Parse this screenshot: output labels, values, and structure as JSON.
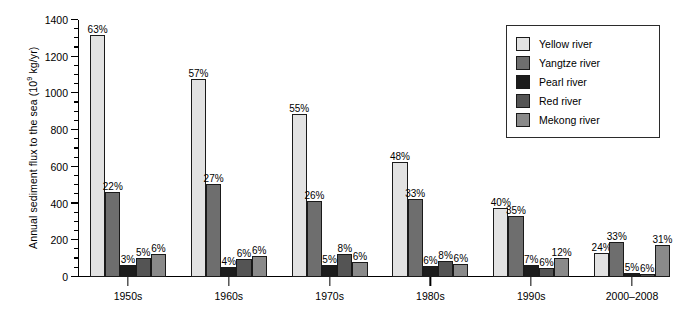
{
  "chart_data": {
    "type": "bar",
    "title": "",
    "xlabel": "",
    "ylabel": "Annual sediment flux to the sea (10⁹ kg/yr)",
    "ylabel_prefix": "Annual sediment flux to the sea (10",
    "ylabel_exponent": "9",
    "ylabel_suffix": " kg/yr)",
    "ylim": [
      0,
      1400
    ],
    "ytick_step": 200,
    "yminor_step": 50,
    "grid": false,
    "legend_position": "top-right",
    "categories": [
      "1950s",
      "1960s",
      "1970s",
      "1980s",
      "1990s",
      "2000–2008"
    ],
    "series": [
      {
        "name": "Yellow river",
        "color": "#e2e2e2",
        "values": [
          1320,
          1080,
          890,
          625,
          375,
          130
        ],
        "labels": [
          "63%",
          "57%",
          "55%",
          "48%",
          "40%",
          "24%"
        ]
      },
      {
        "name": "Yangtze river",
        "color": "#6e6e6e",
        "values": [
          465,
          505,
          415,
          425,
          330,
          190
        ],
        "labels": [
          "22%",
          "27%",
          "26%",
          "33%",
          "35%",
          "33%"
        ]
      },
      {
        "name": "Pearl river",
        "color": "#1c1c1c",
        "values": [
          65,
          55,
          65,
          60,
          65,
          20
        ],
        "labels": [
          "3%",
          "4%",
          "5%",
          "6%",
          "7%",
          "5%"
        ]
      },
      {
        "name": "Red river",
        "color": "#545454",
        "values": [
          105,
          100,
          125,
          85,
          48,
          15
        ],
        "labels": [
          "5%",
          "6%",
          "8%",
          "8%",
          "6%",
          "6%"
        ]
      },
      {
        "name": "Mekong river",
        "color": "#8a8a8a",
        "values": [
          125,
          115,
          80,
          70,
          105,
          175
        ],
        "labels": [
          "6%",
          "6%",
          "6%",
          "6%",
          "12%",
          "31%"
        ]
      }
    ],
    "ytick_labels": [
      "0",
      "200",
      "400",
      "600",
      "800",
      "1000",
      "1200",
      "1400"
    ]
  }
}
